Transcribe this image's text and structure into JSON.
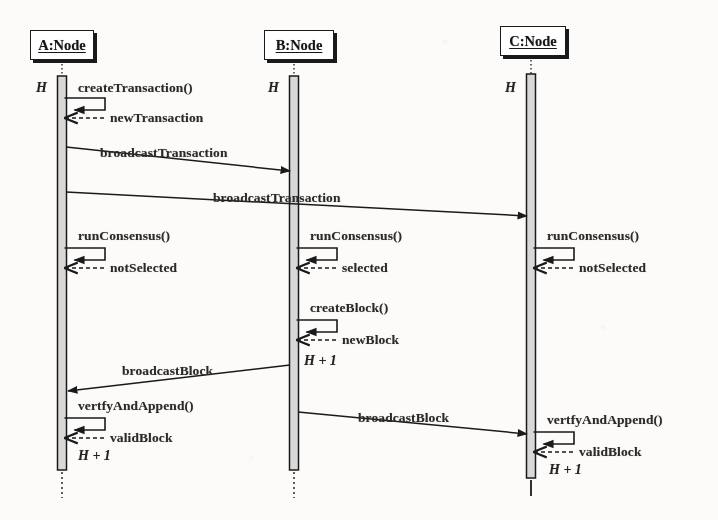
{
  "diagram": {
    "type": "uml-sequence-diagram",
    "background_color": "#fcfbfa",
    "line_color": "#1a1a1a",
    "activation_fill": "#d8d8d8"
  },
  "lifelines": [
    {
      "id": "A",
      "name": "A:Node",
      "box_x": 30,
      "box_y": 30,
      "box_w": 62,
      "box_h": 28,
      "axis_x": 62,
      "bar_top": 76,
      "bar_bottom": 470,
      "tail_bottom": 498,
      "tail_style": "dotted",
      "header_label": "H",
      "header_label_x": 36,
      "header_label_y": 80
    },
    {
      "id": "B",
      "name": "B:Node",
      "box_x": 264,
      "box_y": 30,
      "box_w": 68,
      "box_h": 28,
      "axis_x": 294,
      "bar_top": 76,
      "bar_bottom": 470,
      "tail_bottom": 498,
      "tail_style": "dotted",
      "header_label": "H",
      "header_label_x": 268,
      "header_label_y": 80
    },
    {
      "id": "C",
      "name": "C:Node",
      "box_x": 500,
      "box_y": 26,
      "box_w": 64,
      "box_h": 28,
      "axis_x": 531,
      "bar_top": 74,
      "bar_bottom": 478,
      "tail_bottom": 496,
      "tail_style": "solid",
      "header_label": "H",
      "header_label_x": 505,
      "header_label_y": 80
    }
  ],
  "self_messages": [
    {
      "id": "a-createTransaction",
      "lifeline": "A",
      "call_label": "createTransaction()",
      "return_label": "newTransaction",
      "call_label_x": 78,
      "call_label_y": 80,
      "box_top": 98,
      "box_right": 105,
      "return_y": 118,
      "return_label_x": 110,
      "return_label_y": 110
    },
    {
      "id": "a-runConsensus",
      "lifeline": "A",
      "call_label": "runConsensus()",
      "return_label": "notSelected",
      "call_label_x": 78,
      "call_label_y": 228,
      "box_top": 248,
      "box_right": 105,
      "return_y": 268,
      "return_label_x": 110,
      "return_label_y": 260
    },
    {
      "id": "a-verifyAndAppend",
      "lifeline": "A",
      "call_label": "vertfyAndAppend()",
      "return_label": "validBlock",
      "call_label_x": 78,
      "call_label_y": 398,
      "box_top": 418,
      "box_right": 105,
      "return_y": 438,
      "return_label_x": 110,
      "return_label_y": 430
    },
    {
      "id": "b-runConsensus",
      "lifeline": "B",
      "call_label": "runConsensus()",
      "return_label": "selected",
      "call_label_x": 310,
      "call_label_y": 228,
      "box_top": 248,
      "box_right": 337,
      "return_y": 268,
      "return_label_x": 342,
      "return_label_y": 260
    },
    {
      "id": "b-createBlock",
      "lifeline": "B",
      "call_label": "createBlock()",
      "return_label": "newBlock",
      "call_label_x": 310,
      "call_label_y": 300,
      "box_top": 320,
      "box_right": 337,
      "return_y": 340,
      "return_label_x": 342,
      "return_label_y": 332
    },
    {
      "id": "c-runConsensus",
      "lifeline": "C",
      "call_label": "runConsensus()",
      "return_label": "notSelected",
      "call_label_x": 547,
      "call_label_y": 228,
      "box_top": 248,
      "box_right": 574,
      "return_y": 268,
      "return_label_x": 579,
      "return_label_y": 260
    },
    {
      "id": "c-verifyAndAppend",
      "lifeline": "C",
      "call_label": "vertfyAndAppend()",
      "return_label": "validBlock",
      "call_label_x": 547,
      "call_label_y": 412,
      "box_top": 432,
      "box_right": 574,
      "return_y": 452,
      "return_label_x": 579,
      "return_label_y": 444
    }
  ],
  "messages": [
    {
      "id": "m1",
      "label": "broadcastTransaction",
      "from": "A",
      "to": "B",
      "x1": 66,
      "y1": 147,
      "x2": 290,
      "y2": 171,
      "label_x": 100,
      "label_y": 145
    },
    {
      "id": "m2",
      "label": "broadcastTransaction",
      "from": "A",
      "to": "C",
      "x1": 66,
      "y1": 192,
      "x2": 527,
      "y2": 216,
      "label_x": 213,
      "label_y": 190
    },
    {
      "id": "m3",
      "label": "broadcastBlock",
      "from": "B",
      "to": "A",
      "x1": 290,
      "y1": 365,
      "x2": 68,
      "y2": 391,
      "label_x": 122,
      "label_y": 363
    },
    {
      "id": "m4",
      "label": "broadcastBlock",
      "from": "B",
      "to": "C",
      "x1": 298,
      "y1": 412,
      "x2": 527,
      "y2": 434,
      "label_x": 358,
      "label_y": 410
    }
  ],
  "height_annotations": [
    {
      "id": "h-b-newblock",
      "text": "H + 1",
      "x": 304,
      "y": 353
    },
    {
      "id": "h-a-validblock",
      "text": "H + 1",
      "x": 78,
      "y": 448
    },
    {
      "id": "h-c-validblock",
      "text": "H + 1",
      "x": 549,
      "y": 462
    }
  ]
}
